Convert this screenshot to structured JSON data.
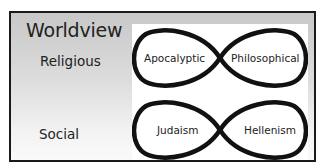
{
  "diagram": {
    "title": "Worldview",
    "rows": [
      {
        "label": "Religious",
        "left": "Apocalyptic",
        "right": "Philosophical"
      },
      {
        "label": "Social",
        "left": "Judaism",
        "right": "Hellenism"
      }
    ],
    "colors": {
      "border": "#1a1a1a",
      "stroke": "#111111",
      "panel": "#ffffff",
      "gradient_top": "#c8c8c8",
      "gradient_bottom": "#fafafa"
    }
  }
}
